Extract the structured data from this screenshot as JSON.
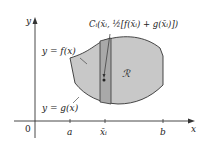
{
  "diagram": {
    "axis_labels": {
      "y": "y",
      "x": "x",
      "origin": "0"
    },
    "tick_labels": {
      "a": "a",
      "xi": "x̄ᵢ",
      "b": "b"
    },
    "curve_labels": {
      "top": "y = f(x)",
      "bottom": "y = g(x)"
    },
    "region_label": "ℛ",
    "centroid_label": "Cᵢ(x̄ᵢ, ½[f(x̄ᵢ) + g(x̄ᵢ)])",
    "colors": {
      "region_fill": "#c8c8c8",
      "strip_fill": "#a9a9a9",
      "stroke": "#333333",
      "background": "#ffffff"
    }
  }
}
